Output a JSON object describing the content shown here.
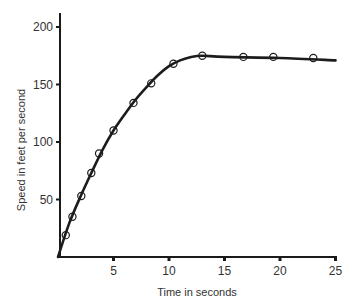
{
  "chart_data": {
    "type": "line",
    "title": "",
    "xlabel": "Time in seconds",
    "ylabel": "Speed in feet per second",
    "xlim": [
      0,
      25
    ],
    "ylim": [
      0,
      200
    ],
    "x_ticks": [
      5,
      10,
      15,
      20,
      25
    ],
    "y_ticks": [
      50,
      100,
      150,
      200
    ],
    "grid": false,
    "legend": null,
    "series": [
      {
        "name": "observed speed",
        "style": "open circle markers",
        "x": [
          0.7,
          1.3,
          2.1,
          3.0,
          3.7,
          5.0,
          6.8,
          8.4,
          10.4,
          13.0,
          16.7,
          19.4,
          23.0
        ],
        "values": [
          19,
          35,
          53,
          73,
          90,
          110,
          134,
          151,
          168,
          175,
          174,
          174,
          173
        ]
      },
      {
        "name": "fitted curve",
        "style": "solid line",
        "x": [
          0,
          1,
          2,
          3,
          4,
          5,
          6,
          7,
          8,
          9,
          10,
          11,
          12,
          13,
          15,
          20,
          25
        ],
        "values": [
          0,
          29,
          52,
          73,
          93,
          110,
          124,
          137,
          148,
          158,
          166,
          171,
          174,
          175,
          174,
          173,
          171
        ]
      }
    ]
  },
  "axes": {
    "x_title": "Time in seconds",
    "y_title": "Speed in feet per second",
    "x_tick_labels": [
      "5",
      "10",
      "15",
      "20",
      "25"
    ],
    "y_tick_labels": [
      "50",
      "100",
      "150",
      "200"
    ]
  }
}
